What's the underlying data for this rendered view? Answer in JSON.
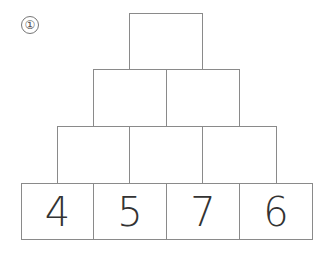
{
  "problem": {
    "number_label": "①"
  },
  "pyramid": {
    "rows": [
      {
        "cells": [
          {
            "value": ""
          }
        ]
      },
      {
        "cells": [
          {
            "value": ""
          },
          {
            "value": ""
          }
        ]
      },
      {
        "cells": [
          {
            "value": ""
          },
          {
            "value": ""
          },
          {
            "value": ""
          }
        ]
      },
      {
        "cells": [
          {
            "value": "4"
          },
          {
            "value": "5"
          },
          {
            "value": "7"
          },
          {
            "value": "6"
          }
        ]
      }
    ]
  }
}
